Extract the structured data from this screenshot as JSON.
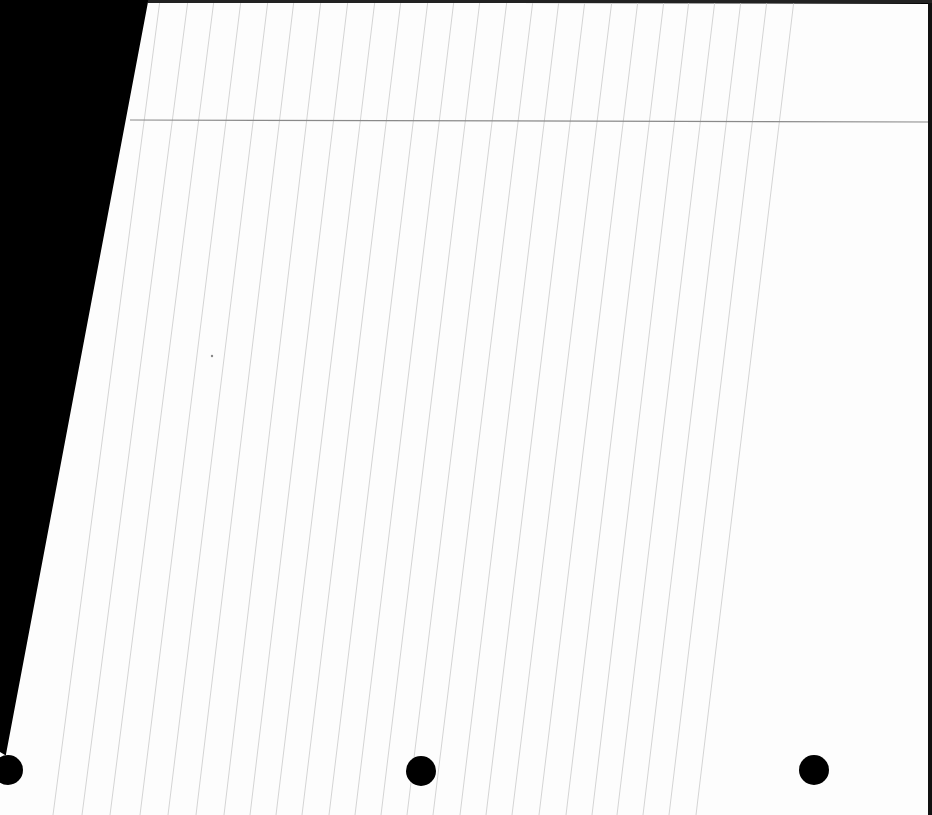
{
  "scene": {
    "description": "Scanned sheet of blank lined paper, slightly skewed, on black background",
    "background_color": "#000000",
    "paper_color": "#fdfdfd",
    "rule_color": "#d4d4d4",
    "header_rule_color": "#8a8a8a",
    "hole_color": "#000000",
    "paper_polygon": "148,2 930,4 928,815 0,815 0,752 10,758 22,770 12,783 0,786",
    "header_rule": {
      "x1": 130,
      "y1": 120,
      "x2": 932,
      "y2": 122
    },
    "vertical_rules_top_x": [
      160,
      188,
      214,
      241,
      268,
      294,
      321,
      348,
      375,
      401,
      428,
      454,
      480,
      507,
      533,
      559,
      585,
      612,
      638,
      664,
      689,
      715,
      741,
      767,
      794
    ],
    "vertical_rules_bottom_x": [
      53,
      82,
      110,
      140,
      168,
      196,
      224,
      250,
      276,
      302,
      329,
      355,
      381,
      407,
      433,
      460,
      486,
      512,
      539,
      566,
      592,
      617,
      643,
      669,
      696
    ],
    "holes": [
      {
        "cx": 421,
        "cy": 771,
        "r": 15
      },
      {
        "cx": 814,
        "cy": 770,
        "r": 15
      },
      {
        "cx": 8,
        "cy": 770,
        "r": 15
      }
    ],
    "text": []
  }
}
